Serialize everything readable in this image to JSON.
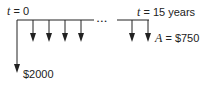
{
  "diagram": {
    "type": "cash-flow-timeline",
    "start_label": {
      "var": "t",
      "eq": " = 0"
    },
    "end_label": {
      "var": "t",
      "eq": " = 15 years"
    },
    "initial_outflow": "$2000",
    "annual_amount": {
      "var": "A",
      "eq": " = $750"
    },
    "ellipsis": "• • •",
    "colors": {
      "line": "#222222",
      "text": "#222222"
    }
  }
}
